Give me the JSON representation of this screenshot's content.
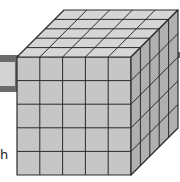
{
  "diagram": {
    "type": "cube-of-unit-cubes",
    "grid": {
      "width": 5,
      "height": 5,
      "depth": 5
    },
    "labels": {
      "left_fragment": "h"
    },
    "colors": {
      "front_face": "#c6c6c6",
      "top_face": "#d6d6d6",
      "side_face": "#b0b0b0",
      "grid_line": "#2a2a2a",
      "bar_frame": "#6b6b6b",
      "bar_inner": "#d2d2d2"
    },
    "geometry": {
      "front": {
        "x": 17,
        "y": 57,
        "w": 114,
        "h": 118
      },
      "depth_offset": {
        "dx": 47,
        "dy": -47
      }
    }
  }
}
